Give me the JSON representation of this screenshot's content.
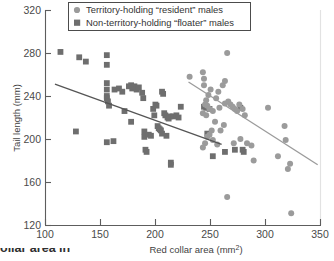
{
  "chart_data": {
    "type": "scatter",
    "title": "",
    "xlabel": "Red collar area (mm2)",
    "ylabel": "Tail length (mm)",
    "xlim": [
      100,
      350
    ],
    "ylim": [
      120,
      320
    ],
    "xticks": [
      100,
      150,
      200,
      250,
      300,
      350
    ],
    "yticks": [
      120,
      160,
      200,
      240,
      280,
      320
    ],
    "grid": false,
    "legend_position": "top-center",
    "series": [
      {
        "name": "Territory-holding “resident” males",
        "marker": "circle",
        "color": "#9b9b9b",
        "points": [
          [
            231,
            258
          ],
          [
            243,
            262
          ],
          [
            244,
            256
          ],
          [
            244,
            250
          ],
          [
            248,
            241
          ],
          [
            250,
            246
          ],
          [
            246,
            236
          ],
          [
            245,
            232
          ],
          [
            247,
            231
          ],
          [
            249,
            228
          ],
          [
            243,
            224
          ],
          [
            246,
            222
          ],
          [
            252,
            226
          ],
          [
            255,
            238
          ],
          [
            257,
            244
          ],
          [
            261,
            250
          ],
          [
            263,
            254
          ],
          [
            265,
            280
          ],
          [
            266,
            235
          ],
          [
            268,
            232
          ],
          [
            270,
            230
          ],
          [
            272,
            228
          ],
          [
            274,
            226
          ],
          [
            276,
            232
          ],
          [
            279,
            228
          ],
          [
            281,
            222
          ],
          [
            263,
            233
          ],
          [
            258,
            229
          ],
          [
            254,
            216
          ],
          [
            251,
            208
          ],
          [
            249,
            204
          ],
          [
            247,
            202
          ],
          [
            245,
            196
          ],
          [
            243,
            192
          ],
          [
            252,
            199
          ],
          [
            256,
            195
          ],
          [
            259,
            208
          ],
          [
            262,
            213
          ],
          [
            265,
            146
          ],
          [
            271,
            196
          ],
          [
            277,
            200
          ],
          [
            283,
            196
          ],
          [
            287,
            194
          ],
          [
            289,
            180
          ],
          [
            302,
            229
          ],
          [
            311,
            184
          ],
          [
            317,
            212
          ],
          [
            318,
            199
          ],
          [
            320,
            172
          ],
          [
            322,
            177
          ],
          [
            323,
            131
          ]
        ]
      },
      {
        "name": "Non-territory-holding “floater” males",
        "marker": "square",
        "color": "#6e6e6e",
        "points": [
          [
            114,
            281
          ],
          [
            128,
            207
          ],
          [
            131,
            276
          ],
          [
            137,
            272
          ],
          [
            156,
            278
          ],
          [
            156,
            269
          ],
          [
            156,
            252
          ],
          [
            156,
            246
          ],
          [
            156,
            240
          ],
          [
            156,
            238
          ],
          [
            156,
            197
          ],
          [
            157,
            235
          ],
          [
            158,
            231
          ],
          [
            162,
            198
          ],
          [
            163,
            246
          ],
          [
            167,
            247
          ],
          [
            170,
            244
          ],
          [
            172,
            226
          ],
          [
            176,
            249
          ],
          [
            178,
            250
          ],
          [
            179,
            247
          ],
          [
            181,
            249
          ],
          [
            183,
            246
          ],
          [
            185,
            248
          ],
          [
            178,
            216
          ],
          [
            188,
            243
          ],
          [
            189,
            238
          ],
          [
            190,
            207
          ],
          [
            190,
            202
          ],
          [
            191,
            190
          ],
          [
            192,
            188
          ],
          [
            194,
            204
          ],
          [
            196,
            203
          ],
          [
            198,
            228
          ],
          [
            199,
            222
          ],
          [
            200,
            232
          ],
          [
            201,
            231
          ],
          [
            202,
            212
          ],
          [
            203,
            210
          ],
          [
            204,
            209
          ],
          [
            205,
            208
          ],
          [
            206,
            205
          ],
          [
            206,
            244
          ],
          [
            207,
            242
          ],
          [
            208,
            224
          ],
          [
            209,
            222
          ],
          [
            210,
            203
          ],
          [
            211,
            220
          ],
          [
            212,
            219
          ],
          [
            213,
            221
          ],
          [
            214,
            178
          ],
          [
            214,
            176
          ],
          [
            216,
            221
          ],
          [
            219,
            222
          ],
          [
            221,
            220
          ],
          [
            223,
            230
          ],
          [
            244,
            230
          ],
          [
            246,
            229
          ],
          [
            247,
            205
          ],
          [
            249,
            228
          ],
          [
            252,
            184
          ],
          [
            263,
            188
          ],
          [
            272,
            190
          ],
          [
            277,
            229
          ],
          [
            279,
            190
          ],
          [
            280,
            188
          ]
        ]
      }
    ],
    "trendlines": [
      {
        "name": "floater-trendline",
        "color": "#555555",
        "x1": 109,
        "y1": 251,
        "x2": 260,
        "y2": 195
      },
      {
        "name": "resident-trendline",
        "color": "#9b9b9b",
        "x1": 230,
        "y1": 253,
        "x2": 347,
        "y2": 176
      }
    ]
  },
  "legend": {
    "items": [
      {
        "label": "Territory-holding “resident” males",
        "marker": "circle-marker"
      },
      {
        "label": "Non-territory-holding “floater” males",
        "marker": "square-marker"
      }
    ]
  },
  "caption": {
    "text": "ollar area in"
  }
}
